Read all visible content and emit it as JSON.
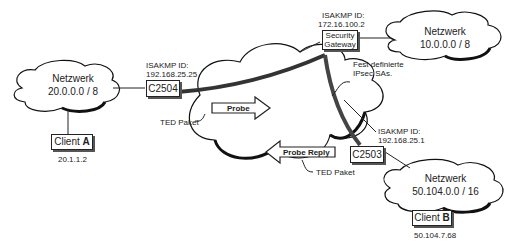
{
  "networks": [
    {
      "id": "net-a",
      "label": "Netzwerk",
      "address": "20.0.0.0 / 8"
    },
    {
      "id": "net-10",
      "label": "Netzwerk",
      "address": "10.0.0.0 / 8"
    },
    {
      "id": "net-b",
      "label": "Netzwerk",
      "address": "50.104.0.0 / 16"
    }
  ],
  "routers": {
    "c2504": {
      "label": "C2504",
      "isakmp_label": "ISAKMP ID:",
      "isakmp_id": "192.168.25.25"
    },
    "gateway": {
      "label_line1": "Security",
      "label_line2": "Gateway",
      "isakmp_label": "ISAKMP ID:",
      "isakmp_id": "172.16.100.2"
    },
    "c2503": {
      "label": "C2503",
      "isakmp_label": "ISAKMP ID:",
      "isakmp_id": "192.168.25.1"
    }
  },
  "clients": {
    "a": {
      "label": "Client ",
      "letter": "A",
      "ip": "20.1.1.2"
    },
    "b": {
      "label": "Client ",
      "letter": "B",
      "ip": "50.104.7.68"
    }
  },
  "packets": {
    "probe": "Probe",
    "probe_reply": "Probe Reply",
    "ted_label_1": "TED Paket",
    "ted_label_2": "TED Paket"
  },
  "annotations": {
    "fixed_sa_line1": "Fest definierte",
    "fixed_sa_line2": "IPsec SAs."
  }
}
